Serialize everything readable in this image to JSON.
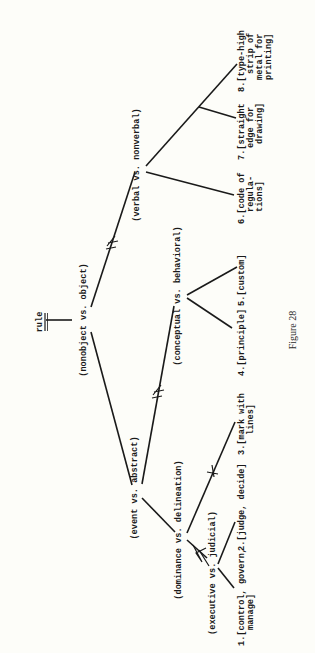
{
  "diagram": {
    "root": "rule",
    "nodes": {
      "nonobject": "(nonobject vs. object)",
      "verbal": "(verbal vs. nonverbal)",
      "event": "(event vs. abstract)",
      "conceptual": "(conceptual vs. behavioral)",
      "dominance": "(dominance vs. delineation)",
      "executive": "(executive vs. judicial)"
    },
    "leaves": {
      "l1": [
        "1.[control, govern,",
        "manage]"
      ],
      "l2": [
        "2.[judge, decide]"
      ],
      "l3": [
        "3.[mark with",
        "lines]"
      ],
      "l4": [
        "4.[principle]"
      ],
      "l5": [
        "5.[custom]"
      ],
      "l6": [
        "6.[code of",
        "regula-",
        "tions]"
      ],
      "l7": [
        "7.[straight",
        "edge for",
        "drawing]"
      ],
      "l8": [
        "8.[type-high",
        "strip of",
        "metal for",
        "printing]"
      ]
    },
    "caption": "Figure 28",
    "orientation": "rotated 90° counter-clockwise"
  }
}
